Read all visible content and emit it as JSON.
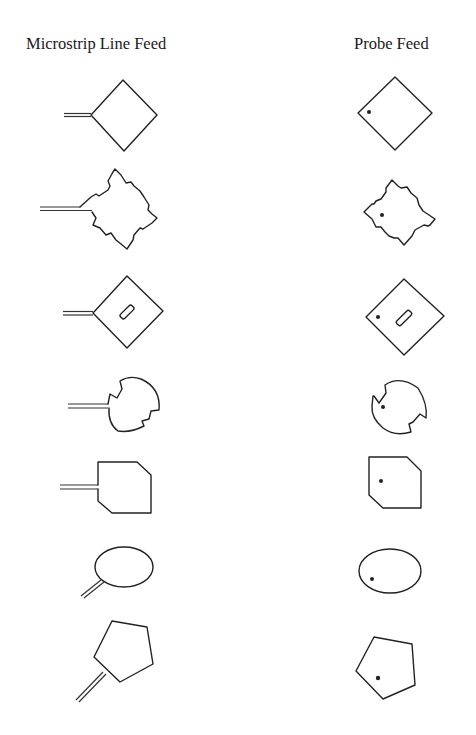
{
  "columns": {
    "left": {
      "title": "Microstrip Line Feed"
    },
    "right": {
      "title": "Probe Feed"
    }
  },
  "rows": [
    {
      "shape": "square patch (diamond orientation)",
      "left_feed": "microstrip line",
      "right_feed": "probe dot"
    },
    {
      "shape": "square patch with stepped notches",
      "left_feed": "microstrip line",
      "right_feed": "probe dot"
    },
    {
      "shape": "square patch with inclined slot",
      "left_feed": "microstrip line",
      "right_feed": "probe dot"
    },
    {
      "shape": "circular patch with notches",
      "left_feed": "microstrip line",
      "right_feed": "probe dot"
    },
    {
      "shape": "truncated-corner square patch",
      "left_feed": "microstrip line",
      "right_feed": "probe dot"
    },
    {
      "shape": "elliptical patch",
      "left_feed": "microstrip line",
      "right_feed": "probe dot"
    },
    {
      "shape": "pentagonal patch",
      "left_feed": "microstrip line",
      "right_feed": "probe dot"
    }
  ],
  "colors": {
    "stroke": "#222222",
    "background": "#ffffff"
  }
}
